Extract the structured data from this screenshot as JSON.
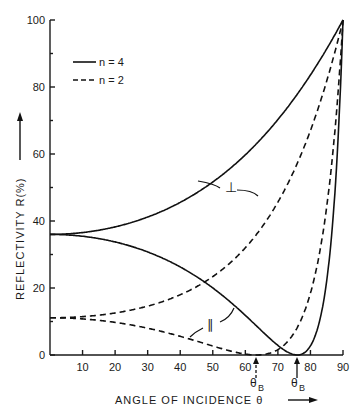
{
  "chart_data": {
    "type": "line",
    "title": "",
    "xlabel": "ANGLE OF INCIDENCE θ",
    "ylabel": "REFLECTIVITY R(%)",
    "xlim": [
      0,
      90
    ],
    "ylim": [
      0,
      100
    ],
    "x_ticks": [
      10,
      20,
      30,
      40,
      50,
      60,
      70,
      80,
      90
    ],
    "y_ticks": [
      0,
      20,
      40,
      60,
      80,
      100
    ],
    "grid": false,
    "legend": {
      "position": "upper-left",
      "entries": [
        {
          "label": "n = 4",
          "style": "solid"
        },
        {
          "label": "n = 2",
          "style": "dashed"
        }
      ]
    },
    "annotations": [
      {
        "text": "⊥",
        "target": "perpendicular curves",
        "x": 56,
        "y": 50
      },
      {
        "text": "∥",
        "target": "parallel curves",
        "x": 50,
        "y": 9
      },
      {
        "text": "θB",
        "x": 63.4,
        "note": "Brewster angle n=2 (dashed arrow)"
      },
      {
        "text": "θB",
        "x": 76.0,
        "note": "Brewster angle n=4 (solid arrow)"
      }
    ],
    "series": [
      {
        "name": "n=4 perpendicular",
        "style": "solid",
        "x": [
          0,
          10,
          20,
          30,
          40,
          50,
          60,
          70,
          80,
          85,
          90
        ],
        "values": [
          36,
          36.7,
          38.9,
          42.9,
          48.9,
          57.3,
          67.9,
          80.0,
          91.5,
          96.6,
          100
        ]
      },
      {
        "name": "n=4 parallel",
        "style": "solid",
        "x": [
          0,
          10,
          20,
          30,
          40,
          50,
          60,
          70,
          76,
          80,
          85,
          90
        ],
        "values": [
          36,
          35.3,
          33.0,
          29.2,
          23.6,
          16.1,
          7.9,
          1.2,
          0,
          1.6,
          19.2,
          100
        ]
      },
      {
        "name": "n=2 perpendicular",
        "style": "dashed",
        "x": [
          0,
          10,
          20,
          30,
          40,
          50,
          60,
          70,
          80,
          85,
          90
        ],
        "values": [
          11.1,
          11.7,
          13.5,
          16.7,
          21.7,
          29.2,
          40.0,
          55.3,
          76.0,
          87.5,
          100
        ]
      },
      {
        "name": "n=2 parallel",
        "style": "dashed",
        "x": [
          0,
          10,
          20,
          30,
          40,
          50,
          60,
          63.4,
          70,
          80,
          85,
          90
        ],
        "values": [
          11.1,
          10.6,
          9.2,
          6.9,
          4.1,
          1.5,
          0.1,
          0,
          1.5,
          18.3,
          43.6,
          100
        ]
      }
    ]
  },
  "legend_labels": {
    "solid": "n = 4",
    "dashed": "n = 2"
  },
  "axis_labels": {
    "x": "ANGLE OF INCIDENCE θ",
    "y": "REFLECTIVITY R(%)"
  },
  "curve_labels": {
    "perp": "⊥",
    "par": "∥"
  },
  "brewster_label": "θ",
  "brewster_sub": "B"
}
